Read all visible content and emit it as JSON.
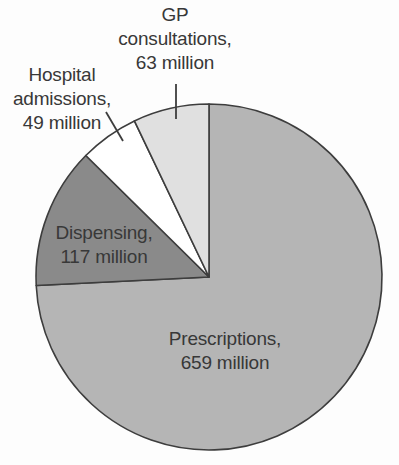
{
  "figure": {
    "background_color": "#fdfdfd",
    "text_color": "#383838"
  },
  "chart_data": {
    "type": "pie",
    "title": "",
    "unit": "million",
    "direction": "clockwise",
    "start_angle_deg": 0,
    "outline_color": "#3d3d3d",
    "leader_line_color": "#3d3d3d",
    "slices": [
      {
        "label": "Prescriptions",
        "value": 659,
        "display": "Prescriptions,\n659 million",
        "color": "#b5b5b5"
      },
      {
        "label": "Dispensing",
        "value": 117,
        "display": "Dispensing,\n117 million",
        "color": "#8a8a8a"
      },
      {
        "label": "Hospital admissions",
        "value": 49,
        "display": "Hospital\nadmissions,\n49 million",
        "color": "#ffffff"
      },
      {
        "label": "GP consultations",
        "value": 63,
        "display": "GP\nconsultations,\n63 million",
        "color": "#e0e0e0"
      }
    ]
  }
}
